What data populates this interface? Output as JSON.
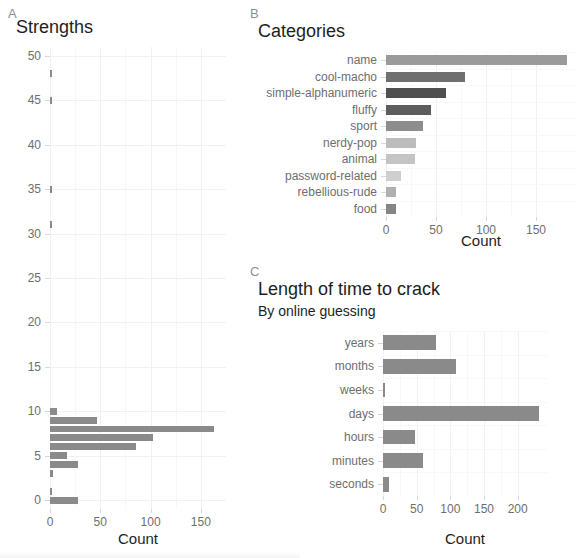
{
  "figure": {
    "background": "#ffffff",
    "bar_color": "#8a8a8a",
    "grid_color": "#f0f1f2",
    "tick_label_color": "#6e6e6e"
  },
  "panels": {
    "a": {
      "letter": "A",
      "title": "Strengths",
      "xlabel": "Count"
    },
    "b": {
      "letter": "B",
      "title": "Categories",
      "xlabel": "Count"
    },
    "c": {
      "letter": "C",
      "title": "Length of time to crack",
      "subtitle": "By online guessing",
      "xlabel": "Count"
    }
  },
  "chart_data": [
    {
      "id": "panel-a",
      "type": "bar",
      "orientation": "horizontal",
      "title": "Strengths",
      "xlabel": "Count",
      "ylabel": "",
      "xlim": [
        0,
        175
      ],
      "ylim": [
        51,
        -1
      ],
      "xticks": [
        0,
        50,
        100,
        150
      ],
      "yticks": [
        0,
        5,
        10,
        15,
        20,
        25,
        30,
        35,
        40,
        45,
        50
      ],
      "grid": true,
      "legend": null,
      "categories": [
        0,
        1,
        2,
        3,
        4,
        5,
        6,
        7,
        8,
        9,
        10,
        31,
        35,
        45,
        48
      ],
      "values": [
        28,
        2,
        0,
        3,
        28,
        17,
        86,
        102,
        163,
        47,
        7,
        1,
        1,
        1,
        1
      ]
    },
    {
      "id": "panel-b",
      "type": "bar",
      "orientation": "horizontal",
      "title": "Categories",
      "xlabel": "Count",
      "ylabel": "",
      "xlim": [
        0,
        190
      ],
      "xticks": [
        0,
        50,
        100,
        150
      ],
      "grid": true,
      "legend": null,
      "categories": [
        "name",
        "cool-macho",
        "simple-alphanumeric",
        "fluffy",
        "sport",
        "nerdy-pop",
        "animal",
        "password-related",
        "rebellious-rude",
        "food"
      ],
      "values": [
        181,
        79,
        60,
        45,
        37,
        30,
        29,
        15,
        10,
        10
      ],
      "bar_colors": [
        "#9a9a9a",
        "#6f6f6f",
        "#4f4f4f",
        "#5d5d5d",
        "#8d8d8d",
        "#bcbcbc",
        "#c4c4c4",
        "#cfcfcf",
        "#b0b0b0",
        "#858585"
      ]
    },
    {
      "id": "panel-c",
      "type": "bar",
      "orientation": "horizontal",
      "title": "Length of time to crack",
      "subtitle": "By online guessing",
      "xlabel": "Count",
      "ylabel": "",
      "xlim": [
        0,
        245
      ],
      "xticks": [
        0,
        50,
        100,
        150,
        200
      ],
      "grid": true,
      "legend": null,
      "categories": [
        "years",
        "months",
        "weeks",
        "days",
        "hours",
        "minutes",
        "seconds"
      ],
      "values": [
        78,
        108,
        2,
        232,
        47,
        60,
        9
      ]
    }
  ]
}
